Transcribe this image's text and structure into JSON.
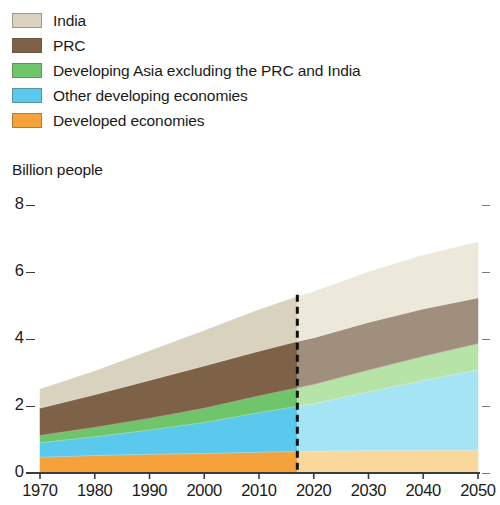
{
  "legend": {
    "items": [
      {
        "label": "India",
        "color": "#d8d2bf",
        "forecast_color": "#ece8da",
        "swatch_name": "legend-swatch-india"
      },
      {
        "label": "PRC",
        "color": "#7d6248",
        "forecast_color": "#a08f7c",
        "swatch_name": "legend-swatch-prc"
      },
      {
        "label": "Developing Asia excluding the PRC and India",
        "color": "#6fc56a",
        "forecast_color": "#b6e3a6",
        "swatch_name": "legend-swatch-developing-asia"
      },
      {
        "label": "Other developing economies",
        "color": "#5bc9ed",
        "forecast_color": "#a5e4f4",
        "swatch_name": "legend-swatch-other-developing"
      },
      {
        "label": "Developed economies",
        "color": "#f5a13c",
        "forecast_color": "#fad79a",
        "swatch_name": "legend-swatch-developed"
      }
    ]
  },
  "axis_title": "Billion people",
  "chart_data": {
    "type": "area",
    "stacked": true,
    "title": "",
    "subtitle": "",
    "xlabel": "",
    "ylabel": "Billion people",
    "xlim": [
      1970,
      2050
    ],
    "ylim": [
      0,
      8
    ],
    "grid": false,
    "legend_position": "top-left",
    "x_ticks": [
      1970,
      1980,
      1990,
      2000,
      2010,
      2020,
      2030,
      2040,
      2050
    ],
    "y_ticks": [
      0,
      2,
      4,
      6,
      8
    ],
    "forecast_start": 2017,
    "forecast_divider_style": "dashed",
    "x": [
      1970,
      1980,
      1990,
      2000,
      2010,
      2017,
      2020,
      2030,
      2040,
      2050
    ],
    "series": [
      {
        "name": "Developed economies",
        "color": "#f5a13c",
        "forecast_color": "#fad79a",
        "values": [
          0.47,
          0.52,
          0.56,
          0.58,
          0.62,
          0.64,
          0.65,
          0.67,
          0.68,
          0.68
        ]
      },
      {
        "name": "Other developing economies",
        "color": "#5bc9ed",
        "forecast_color": "#a5e4f4",
        "values": [
          0.43,
          0.56,
          0.72,
          0.93,
          1.18,
          1.35,
          1.42,
          1.75,
          2.08,
          2.4
        ]
      },
      {
        "name": "Developing Asia excluding the PRC and India",
        "color": "#6fc56a",
        "forecast_color": "#b6e3a6",
        "values": [
          0.22,
          0.28,
          0.35,
          0.42,
          0.5,
          0.55,
          0.57,
          0.65,
          0.72,
          0.78
        ]
      },
      {
        "name": "PRC",
        "color": "#7d6248",
        "forecast_color": "#a08f7c",
        "values": [
          0.82,
          0.98,
          1.14,
          1.27,
          1.34,
          1.39,
          1.4,
          1.43,
          1.42,
          1.37
        ]
      },
      {
        "name": "India",
        "color": "#d8d2bf",
        "forecast_color": "#ece8da",
        "values": [
          0.56,
          0.7,
          0.87,
          1.05,
          1.23,
          1.33,
          1.37,
          1.5,
          1.6,
          1.66
        ]
      }
    ],
    "totals": [
      2.5,
      3.04,
      3.64,
      4.25,
      4.87,
      5.26,
      5.41,
      6.0,
      6.5,
      6.89
    ]
  }
}
